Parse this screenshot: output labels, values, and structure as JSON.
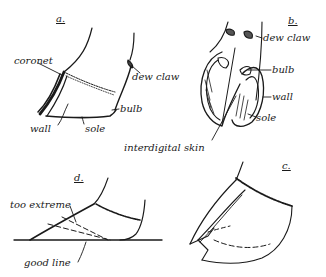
{
  "figure": {
    "panels": [
      {
        "id": "a",
        "label": "a.",
        "description": "side view of hoof",
        "parts": [
          "coronet",
          "dew claw",
          "bulb",
          "wall",
          "sole"
        ]
      },
      {
        "id": "b",
        "label": "b.",
        "description": "underside view of cloven hoof",
        "parts": [
          "dew claw",
          "bulb",
          "wall",
          "sole"
        ]
      },
      {
        "id": "c",
        "label": "c.",
        "description": "overgrown hoof with trimming lines"
      },
      {
        "id": "d",
        "label": "d.",
        "description": "trimming guide",
        "parts": [
          "too extreme",
          "good line"
        ]
      }
    ],
    "shared_label": "interdigital skin",
    "ink_color": "#1a1a1a",
    "background": "#ffffff"
  },
  "labels": {
    "a_title": "a.",
    "a_coronet": "coronet",
    "a_dew_claw": "dew claw",
    "a_bulb": "bulb",
    "a_wall": "wall",
    "a_sole": "sole",
    "b_title": "b.",
    "b_dew_claw": "dew claw",
    "b_bulb": "bulb",
    "b_wall": "wall",
    "b_sole": "sole",
    "interdigital": "interdigital skin",
    "c_title": "c.",
    "d_title": "d.",
    "d_too_extreme": "too extreme",
    "d_good_line": "good line"
  }
}
